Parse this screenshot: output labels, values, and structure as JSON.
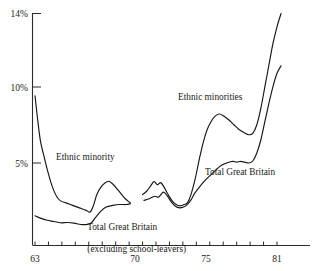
{
  "chart_data": {
    "type": "line",
    "title": "",
    "xlabel": "",
    "ylabel": "",
    "xlim": [
      62.3,
      81.8
    ],
    "ylim": [
      0,
      14.6
    ],
    "grid": false,
    "legend_position": "inline-annotations",
    "y_ticks": [
      5,
      10,
      14
    ],
    "y_tick_labels": [
      "5%",
      "10%",
      "14%"
    ],
    "x_ticks": [
      63,
      64,
      65,
      66,
      67,
      68,
      69,
      70,
      71,
      72,
      73,
      74,
      75,
      76,
      77,
      78,
      79,
      80,
      81
    ],
    "x_tick_labels_shown": [
      "63",
      "70",
      "75",
      "81"
    ],
    "annotations": [
      {
        "text": "Ethnic minority",
        "x": 66.0,
        "y": 5.2
      },
      {
        "text": "Ethnic minorities",
        "x": 75.2,
        "y": 8.6
      },
      {
        "text": "Total Great Britain",
        "x": 77.0,
        "y": 4.5
      },
      {
        "text": "Total Great Britain",
        "x": 67.6,
        "y": 1.7
      },
      {
        "text": "(excluding school-leavers)",
        "x": 67.6,
        "y": 1.0
      }
    ],
    "series": [
      {
        "name": "Ethnic minority",
        "segment": "left",
        "points": [
          [
            63.0,
            9.05
          ],
          [
            63.2,
            7.6
          ],
          [
            63.4,
            6.35
          ],
          [
            63.7,
            5.3
          ],
          [
            64.0,
            4.35
          ],
          [
            64.3,
            3.55
          ],
          [
            64.6,
            3.0
          ],
          [
            64.9,
            2.72
          ],
          [
            65.3,
            2.6
          ],
          [
            65.8,
            2.45
          ],
          [
            66.3,
            2.3
          ],
          [
            66.8,
            2.15
          ],
          [
            67.1,
            2.05
          ],
          [
            67.35,
            2.45
          ],
          [
            67.6,
            3.1
          ],
          [
            67.9,
            3.55
          ],
          [
            68.2,
            3.8
          ],
          [
            68.5,
            3.9
          ],
          [
            68.8,
            3.72
          ],
          [
            69.2,
            3.35
          ],
          [
            69.6,
            2.95
          ],
          [
            69.9,
            2.72
          ],
          [
            70.1,
            2.6
          ]
        ]
      },
      {
        "name": "Total Great Britain (excluding school-leavers)",
        "segment": "left",
        "points": [
          [
            63.0,
            1.82
          ],
          [
            63.4,
            1.68
          ],
          [
            63.9,
            1.55
          ],
          [
            64.4,
            1.48
          ],
          [
            64.9,
            1.4
          ],
          [
            65.4,
            1.42
          ],
          [
            65.9,
            1.38
          ],
          [
            66.4,
            1.3
          ],
          [
            66.9,
            1.3
          ],
          [
            67.2,
            1.4
          ],
          [
            67.5,
            1.72
          ],
          [
            67.9,
            2.1
          ],
          [
            68.3,
            2.35
          ],
          [
            68.8,
            2.45
          ],
          [
            69.3,
            2.5
          ],
          [
            69.8,
            2.5
          ],
          [
            70.1,
            2.55
          ]
        ]
      },
      {
        "name": "Ethnic minorities",
        "segment": "right",
        "points": [
          [
            71.0,
            3.1
          ],
          [
            71.3,
            3.3
          ],
          [
            71.6,
            3.62
          ],
          [
            71.85,
            3.88
          ],
          [
            72.1,
            3.7
          ],
          [
            72.35,
            3.82
          ],
          [
            72.6,
            3.55
          ],
          [
            72.9,
            3.1
          ],
          [
            73.2,
            2.72
          ],
          [
            73.5,
            2.5
          ],
          [
            73.8,
            2.42
          ],
          [
            74.1,
            2.5
          ],
          [
            74.35,
            2.62
          ],
          [
            74.6,
            3.1
          ],
          [
            74.9,
            4.0
          ],
          [
            75.2,
            5.15
          ],
          [
            75.5,
            6.2
          ],
          [
            75.8,
            7.0
          ],
          [
            76.1,
            7.5
          ],
          [
            76.4,
            7.82
          ],
          [
            76.7,
            7.95
          ],
          [
            77.0,
            7.85
          ],
          [
            77.4,
            7.6
          ],
          [
            77.8,
            7.3
          ],
          [
            78.2,
            7.0
          ],
          [
            78.6,
            6.8
          ],
          [
            78.9,
            6.7
          ],
          [
            79.2,
            6.78
          ],
          [
            79.5,
            7.3
          ],
          [
            79.8,
            8.3
          ],
          [
            80.1,
            9.6
          ],
          [
            80.4,
            10.9
          ],
          [
            80.7,
            12.2
          ],
          [
            81.0,
            13.2
          ],
          [
            81.3,
            14.0
          ]
        ]
      },
      {
        "name": "Total Great Britain",
        "segment": "right",
        "points": [
          [
            71.1,
            2.75
          ],
          [
            71.5,
            2.85
          ],
          [
            71.9,
            3.0
          ],
          [
            72.2,
            2.95
          ],
          [
            72.55,
            3.25
          ],
          [
            72.85,
            3.0
          ],
          [
            73.15,
            2.65
          ],
          [
            73.45,
            2.4
          ],
          [
            73.75,
            2.3
          ],
          [
            74.05,
            2.35
          ],
          [
            74.3,
            2.48
          ],
          [
            74.6,
            2.78
          ],
          [
            74.9,
            3.2
          ],
          [
            75.3,
            3.62
          ],
          [
            75.7,
            4.0
          ],
          [
            76.1,
            4.3
          ],
          [
            76.5,
            4.62
          ],
          [
            76.9,
            4.88
          ],
          [
            77.3,
            5.02
          ],
          [
            77.7,
            5.1
          ],
          [
            78.0,
            5.05
          ],
          [
            78.3,
            5.1
          ],
          [
            78.6,
            5.05
          ],
          [
            78.9,
            5.0
          ],
          [
            79.2,
            5.12
          ],
          [
            79.5,
            5.6
          ],
          [
            79.8,
            6.4
          ],
          [
            80.1,
            7.5
          ],
          [
            80.4,
            8.6
          ],
          [
            80.7,
            9.6
          ],
          [
            81.0,
            10.4
          ],
          [
            81.3,
            10.85
          ]
        ]
      }
    ]
  },
  "axis": {
    "y_label_14": "14%",
    "y_label_10": "10%",
    "y_label_5": "5%",
    "x_label_63": "63",
    "x_label_70": "70",
    "x_label_75": "75",
    "x_label_81": "81"
  },
  "labels": {
    "ethnic_minority": "Ethnic minority",
    "ethnic_minorities": "Ethnic minorities",
    "total_gb_right": "Total Great Britain",
    "total_gb_left_line1": "Total Great Britain",
    "total_gb_left_line2": "(excluding school-leavers)"
  }
}
